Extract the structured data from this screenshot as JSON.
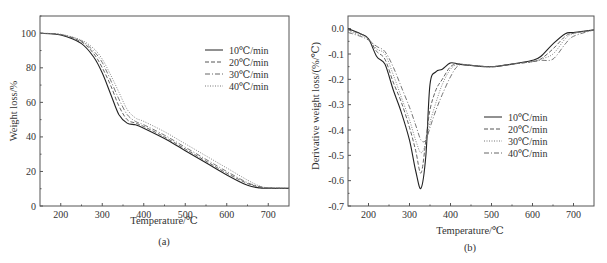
{
  "figure": {
    "panels": [
      {
        "id": "a",
        "caption": "(a)",
        "xlabel": "Temperature/℃",
        "ylabel": "Weight loss/%",
        "x_ticks": [
          "200",
          "300",
          "400",
          "500",
          "600",
          "700"
        ],
        "y_ticks": [
          "0",
          "20",
          "40",
          "60",
          "80",
          "100"
        ],
        "legend": [
          "10℃/min",
          "20℃/min",
          "30℃/min",
          "40℃/min"
        ]
      },
      {
        "id": "b",
        "caption": "(b)",
        "xlabel": "Temperature/℃",
        "ylabel": "Derivative weight loss/(%/℃)",
        "x_ticks": [
          "200",
          "300",
          "400",
          "500",
          "600",
          "700"
        ],
        "y_ticks": [
          "0.0",
          "-0.1",
          "-0.2",
          "-0.3",
          "-0.4",
          "-0.5",
          "-0.6",
          "-0.7"
        ],
        "legend": [
          "10℃/min",
          "20℃/min",
          "30℃/min",
          "40℃/min"
        ]
      }
    ]
  },
  "chart_data": [
    {
      "type": "line",
      "title": "(a)",
      "xlabel": "Temperature/℃",
      "ylabel": "Weight loss/%",
      "xlim": [
        150,
        750
      ],
      "ylim": [
        0,
        110
      ],
      "grid": false,
      "legend_position": "upper right",
      "x_ticks": [
        200,
        300,
        400,
        500,
        600,
        700
      ],
      "y_ticks": [
        0,
        20,
        40,
        60,
        80,
        100
      ],
      "x": [
        150,
        200,
        250,
        280,
        300,
        320,
        340,
        360,
        380,
        400,
        450,
        500,
        550,
        600,
        650,
        680,
        700,
        750
      ],
      "series": [
        {
          "name": "10℃/min",
          "style": "solid",
          "values": [
            100,
            99,
            94,
            86,
            77,
            65,
            53,
            48,
            47,
            45,
            39,
            32,
            25,
            18,
            12,
            10.5,
            10.3,
            10.2
          ]
        },
        {
          "name": "20℃/min",
          "style": "dashed",
          "values": [
            100,
            99.2,
            95,
            88,
            80,
            70,
            58,
            50,
            48,
            46,
            40,
            33,
            26,
            19,
            13,
            11,
            10.4,
            10.2
          ]
        },
        {
          "name": "30℃/min",
          "style": "dashdot",
          "values": [
            100,
            99.3,
            95.5,
            89.5,
            83,
            73,
            62,
            53,
            49,
            47,
            41,
            34,
            27,
            20,
            13.5,
            11.2,
            10.5,
            10.2
          ]
        },
        {
          "name": "40℃/min",
          "style": "dotted",
          "values": [
            100,
            99.4,
            96,
            91,
            85,
            76,
            66,
            56,
            51,
            49,
            43,
            36,
            29,
            22,
            15,
            11.5,
            10.6,
            10.3
          ]
        }
      ]
    },
    {
      "type": "line",
      "title": "(b)",
      "xlabel": "Temperature/℃",
      "ylabel": "Derivative weight loss/(%/℃)",
      "xlim": [
        150,
        750
      ],
      "ylim": [
        -0.7,
        0.05
      ],
      "grid": false,
      "legend_position": "center right",
      "x_ticks": [
        200,
        300,
        400,
        500,
        600,
        700
      ],
      "y_ticks": [
        0.0,
        -0.1,
        -0.2,
        -0.3,
        -0.4,
        -0.5,
        -0.6,
        -0.7
      ],
      "x": [
        150,
        180,
        200,
        220,
        240,
        260,
        280,
        300,
        315,
        328,
        340,
        350,
        365,
        380,
        400,
        420,
        450,
        500,
        550,
        600,
        620,
        650,
        680,
        700,
        750
      ],
      "series": [
        {
          "name": "10℃/min",
          "style": "solid",
          "values": [
            0.0,
            -0.02,
            -0.04,
            -0.11,
            -0.14,
            -0.24,
            -0.33,
            -0.44,
            -0.56,
            -0.63,
            -0.5,
            -0.22,
            -0.17,
            -0.16,
            -0.135,
            -0.14,
            -0.145,
            -0.15,
            -0.14,
            -0.125,
            -0.11,
            -0.06,
            -0.02,
            -0.015,
            -0.005
          ]
        },
        {
          "name": "20℃/min",
          "style": "dashed",
          "values": [
            -0.005,
            -0.02,
            -0.04,
            -0.09,
            -0.12,
            -0.21,
            -0.29,
            -0.39,
            -0.48,
            -0.57,
            -0.44,
            -0.32,
            -0.24,
            -0.2,
            -0.15,
            -0.14,
            -0.145,
            -0.15,
            -0.14,
            -0.13,
            -0.12,
            -0.08,
            -0.03,
            -0.018,
            -0.005
          ]
        },
        {
          "name": "30℃/min",
          "style": "dotted",
          "values": [
            -0.01,
            -0.025,
            -0.04,
            -0.08,
            -0.1,
            -0.18,
            -0.27,
            -0.36,
            -0.44,
            -0.49,
            -0.45,
            -0.37,
            -0.29,
            -0.22,
            -0.16,
            -0.14,
            -0.145,
            -0.15,
            -0.14,
            -0.13,
            -0.12,
            -0.1,
            -0.04,
            -0.02,
            -0.005
          ]
        },
        {
          "name": "40℃/min",
          "style": "dashdot",
          "values": [
            -0.015,
            -0.03,
            -0.045,
            -0.07,
            -0.09,
            -0.15,
            -0.23,
            -0.31,
            -0.38,
            -0.44,
            -0.44,
            -0.39,
            -0.32,
            -0.26,
            -0.19,
            -0.145,
            -0.145,
            -0.15,
            -0.14,
            -0.13,
            -0.125,
            -0.12,
            -0.06,
            -0.03,
            -0.005
          ]
        }
      ]
    }
  ]
}
